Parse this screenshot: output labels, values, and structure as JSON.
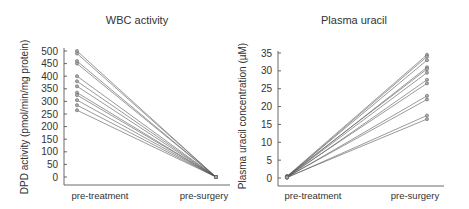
{
  "chart_data": [
    {
      "type": "line",
      "title": "WBC activity",
      "xlabel": "",
      "ylabel": "DPD activity (pmol/min/mg protein)",
      "categories": [
        "pre-treatment",
        "pre-surgery"
      ],
      "ylim": [
        0,
        500
      ],
      "yticks": [
        0,
        50,
        100,
        150,
        200,
        250,
        300,
        350,
        400,
        450,
        500
      ],
      "grid": false,
      "series": [
        {
          "name": "patient-1",
          "values": [
            500,
            0
          ]
        },
        {
          "name": "patient-2",
          "values": [
            490,
            0
          ]
        },
        {
          "name": "patient-3",
          "values": [
            460,
            0
          ]
        },
        {
          "name": "patient-4",
          "values": [
            450,
            0
          ]
        },
        {
          "name": "patient-5",
          "values": [
            400,
            0
          ]
        },
        {
          "name": "patient-6",
          "values": [
            380,
            0
          ]
        },
        {
          "name": "patient-7",
          "values": [
            360,
            0
          ]
        },
        {
          "name": "patient-8",
          "values": [
            335,
            0
          ]
        },
        {
          "name": "patient-9",
          "values": [
            325,
            0
          ]
        },
        {
          "name": "patient-10",
          "values": [
            305,
            0
          ]
        },
        {
          "name": "patient-11",
          "values": [
            285,
            0
          ]
        },
        {
          "name": "patient-12",
          "values": [
            265,
            0
          ]
        }
      ]
    },
    {
      "type": "line",
      "title": "Plasma uracil",
      "xlabel": "",
      "ylabel": "Plasma uracil concentration (µM)",
      "categories": [
        "pre-treatment",
        "pre-surgery"
      ],
      "ylim": [
        0,
        35
      ],
      "yticks": [
        0,
        5,
        10,
        15,
        20,
        25,
        30,
        35
      ],
      "grid": false,
      "series": [
        {
          "name": "patient-1",
          "values": [
            0.5,
            34.5
          ]
        },
        {
          "name": "patient-2",
          "values": [
            0.3,
            34
          ]
        },
        {
          "name": "patient-3",
          "values": [
            0.4,
            33
          ]
        },
        {
          "name": "patient-4",
          "values": [
            0.2,
            31
          ]
        },
        {
          "name": "patient-5",
          "values": [
            0.5,
            30.5
          ]
        },
        {
          "name": "patient-6",
          "values": [
            0.3,
            29.5
          ]
        },
        {
          "name": "patient-7",
          "values": [
            0.1,
            27.5
          ]
        },
        {
          "name": "patient-8",
          "values": [
            0.4,
            26.5
          ]
        },
        {
          "name": "patient-9",
          "values": [
            0.2,
            23
          ]
        },
        {
          "name": "patient-10",
          "values": [
            0.3,
            22
          ]
        },
        {
          "name": "patient-11",
          "values": [
            0.1,
            17.5
          ]
        },
        {
          "name": "patient-12",
          "values": [
            0.2,
            16.5
          ]
        }
      ]
    }
  ],
  "charts": {
    "left": {
      "title": "WBC activity",
      "ylabel": "DPD activity (pmol/min/mg protein)",
      "x_left": "pre-treatment",
      "x_right": "pre-surgery"
    },
    "right": {
      "title": "Plasma uracil",
      "ylabel": "Plasma uracil concentration (µM)",
      "x_left": "pre-treatment",
      "x_right": "pre-surgery"
    }
  },
  "colors": {
    "line": "#555555",
    "axis": "#444444",
    "marker_fill": "#aaaaaa",
    "text": "#333333"
  }
}
